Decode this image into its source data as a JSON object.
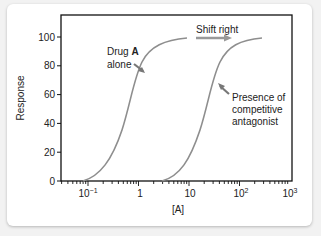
{
  "chart_data": {
    "type": "line",
    "title": "",
    "xlabel": "[A]",
    "ylabel": "Response",
    "xscale": "log",
    "xlim": [
      0.03,
      1000
    ],
    "ylim": [
      0,
      100
    ],
    "x_ticks": [
      "10⁻¹",
      "1",
      "10",
      "10²",
      "10³"
    ],
    "y_ticks": [
      "0",
      "20",
      "40",
      "60",
      "80",
      "100"
    ],
    "series": [
      {
        "name": "Drug A alone",
        "x": [
          0.08,
          0.2,
          0.5,
          1,
          2,
          5,
          10
        ],
        "values": [
          0,
          10,
          35,
          60,
          80,
          95,
          100
        ]
      },
      {
        "name": "Presence of competitive antagonist",
        "x": [
          2,
          5,
          12,
          25,
          50,
          120,
          250
        ],
        "values": [
          0,
          10,
          35,
          60,
          80,
          95,
          100
        ]
      }
    ],
    "annotations": [
      {
        "text": "Drug A alone",
        "target": "Drug A alone curve"
      },
      {
        "text": "Shift right",
        "type": "arrow"
      },
      {
        "text": "Presence of competitive antagonist",
        "target": "antagonist curve"
      }
    ],
    "grid": false,
    "legend": "none"
  },
  "labels": {
    "ylabel": "Response",
    "xlabel": "[A]",
    "drug_a_line1": "Drug ",
    "drug_a_bold": "A",
    "drug_a_line2": "alone",
    "shift": "Shift  right",
    "presence_1": "Presence of",
    "presence_2": "competitive",
    "presence_3": "antagonist",
    "y0": "0",
    "y20": "20",
    "y40": "40",
    "y60": "60",
    "y80": "80",
    "y100": "100",
    "x1_base": "10",
    "x1_exp": "−1",
    "x2": "1",
    "x3": "10",
    "x4_base": "10",
    "x4_exp": "2",
    "x5_base": "10",
    "x5_exp": "3"
  },
  "colors": {
    "curve": "#8a8a8a",
    "axis": "#111111",
    "arrow": "#888888"
  }
}
